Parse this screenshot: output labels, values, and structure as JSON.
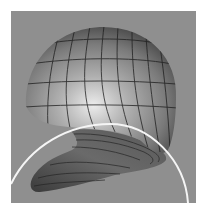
{
  "figure": {
    "colors": {
      "page_background": "#ffffff",
      "panel_background": "#8f8f8f",
      "surface_highlight": "#e6e6e6",
      "surface_mid": "#8a8a8a",
      "surface_shadow": "#3a3a3a",
      "mesh_lines": "#1e1e1e",
      "arc": "#f5f5f5"
    },
    "panel": {
      "x": 11,
      "y": 11,
      "width": 185,
      "height": 192
    }
  }
}
